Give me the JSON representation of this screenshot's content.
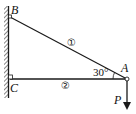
{
  "diagram": {
    "points": {
      "B": {
        "label": "B"
      },
      "C": {
        "label": "C"
      },
      "A": {
        "label": "A"
      }
    },
    "members": [
      {
        "id": "1",
        "label": "①",
        "from": "B",
        "to": "A"
      },
      {
        "id": "2",
        "label": "②",
        "from": "C",
        "to": "A"
      }
    ],
    "angle": {
      "label": "30°",
      "at": "A"
    },
    "load": {
      "label": "P",
      "direction": "down"
    },
    "support": {
      "type": "wall"
    },
    "colors": {
      "line": "#1a1a1a",
      "background": "#ffffff"
    }
  }
}
